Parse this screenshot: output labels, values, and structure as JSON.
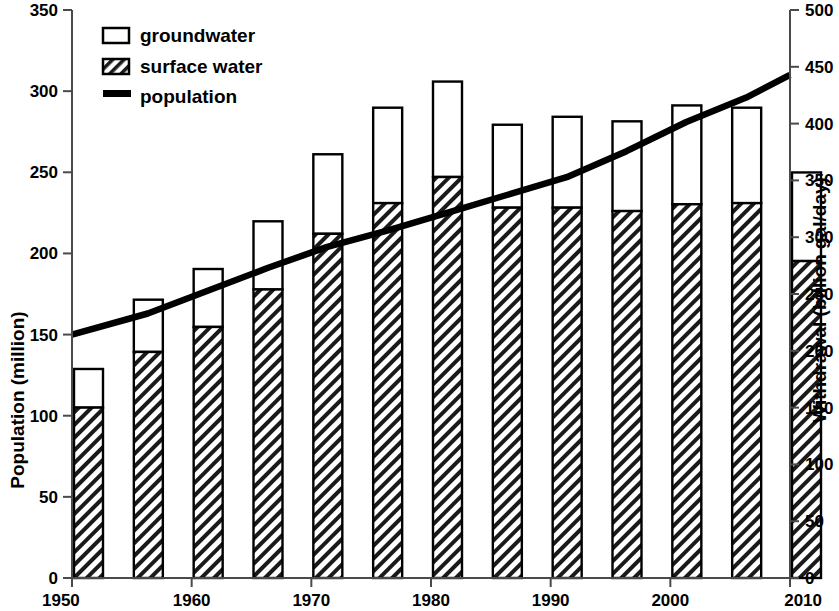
{
  "chart_data": {
    "type": "bar",
    "title": "",
    "xlabel": "",
    "ylabel": "Population (million)",
    "y2label": "Withdrawal (billion gal/day)",
    "xlim": [
      1950,
      2010
    ],
    "ylim": [
      0,
      350
    ],
    "y2lim": [
      0,
      500
    ],
    "grid": false,
    "legend_position": "top-left",
    "x_ticks": [
      "1950",
      "1960",
      "1970",
      "1980",
      "1990",
      "2000",
      "2010"
    ],
    "x_tick_values": [
      1950,
      1960,
      1970,
      1980,
      1990,
      2000,
      2010
    ],
    "y_ticks": [
      "0",
      "50",
      "100",
      "150",
      "200",
      "250",
      "300",
      "350"
    ],
    "y_tick_values": [
      0,
      50,
      100,
      150,
      200,
      250,
      300,
      350
    ],
    "y2_ticks": [
      "0",
      "50",
      "100",
      "150",
      "200",
      "250",
      "300",
      "350",
      "400",
      "450",
      "500"
    ],
    "y2_tick_values": [
      0,
      50,
      100,
      150,
      200,
      250,
      300,
      350,
      400,
      450,
      500
    ],
    "categories": [
      1950,
      1955,
      1960,
      1965,
      1970,
      1975,
      1980,
      1985,
      1990,
      1995,
      2000,
      2005,
      2010
    ],
    "series": [
      {
        "name": "surface water",
        "axis": "right",
        "style": "hatched",
        "values": [
          150,
          199,
          221,
          254,
          303,
          330,
          353,
          326,
          326,
          323,
          329,
          330,
          279
        ]
      },
      {
        "name": "groundwater",
        "axis": "right",
        "style": "open",
        "values": [
          34,
          46,
          51,
          60,
          70,
          84,
          84,
          73,
          80,
          79,
          87,
          84,
          78
        ]
      },
      {
        "name": "population",
        "axis": "left",
        "style": "line",
        "x": [
          1950,
          1955,
          1960,
          1965,
          1970,
          1975,
          1980,
          1985,
          1990,
          1995,
          2000,
          2005,
          2010
        ],
        "values": [
          150,
          163,
          177,
          191,
          204,
          214,
          225,
          236,
          247,
          263,
          281,
          296,
          310
        ]
      }
    ],
    "bar_totals_right_axis": [
      184,
      245,
      272,
      314,
      373,
      414,
      437,
      399,
      406,
      402,
      416,
      414,
      357
    ],
    "legend": [
      "groundwater",
      "surface water",
      "population"
    ]
  },
  "axes": {
    "left_title": "Population (million)",
    "right_title": "Withdrawal (billion gal/day)"
  },
  "legend": {
    "items": [
      {
        "label": "groundwater",
        "marker": "open-square"
      },
      {
        "label": "surface water",
        "marker": "hatched-square"
      },
      {
        "label": "population",
        "marker": "thick-line"
      }
    ]
  },
  "colors": {
    "axis": "#000000",
    "bar_stroke": "#000000",
    "bar_fill_open": "#ffffff",
    "line": "#000000"
  }
}
